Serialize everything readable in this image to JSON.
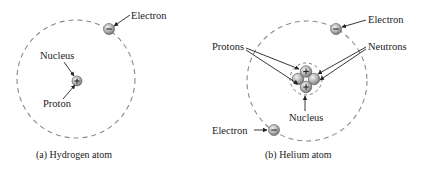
{
  "diagram": {
    "hydrogen": {
      "caption": "(a) Hydrogen atom",
      "labels": {
        "electron": "Electron",
        "nucleus": "Nucleus",
        "proton": "Proton"
      },
      "orbit": {
        "cx": 76,
        "cy": 79,
        "r": 59
      },
      "particles": [
        {
          "type": "electron",
          "sign": "-",
          "cx": 109,
          "cy": 29
        },
        {
          "type": "proton",
          "sign": "+",
          "cx": 77,
          "cy": 81
        }
      ]
    },
    "helium": {
      "caption": "(b) Helium atom",
      "labels": {
        "electron_top": "Electron",
        "electron_bottom": "Electron",
        "protons": "Protons",
        "neutrons": "Neutrons",
        "nucleus": "Nucleus"
      },
      "orbit": {
        "cx": 307,
        "cy": 81,
        "r": 60
      },
      "particles": [
        {
          "type": "electron",
          "sign": "-",
          "cx": 336,
          "cy": 29
        },
        {
          "type": "electron",
          "sign": "-",
          "cx": 274,
          "cy": 130
        },
        {
          "type": "proton",
          "sign": "+",
          "cx": 306,
          "cy": 72
        },
        {
          "type": "proton",
          "sign": "+",
          "cx": 306,
          "cy": 87
        },
        {
          "type": "neutron",
          "sign": "",
          "cx": 298,
          "cy": 79
        },
        {
          "type": "neutron",
          "sign": "",
          "cx": 314,
          "cy": 79
        }
      ]
    },
    "colors": {
      "orbit": "#8a8a8a",
      "particle_fill": "#b5b5b5",
      "text": "#222222"
    }
  }
}
